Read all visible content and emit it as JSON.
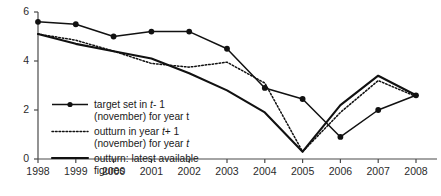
{
  "chart_data": {
    "type": "line",
    "title": "",
    "xlabel": "",
    "ylabel": "",
    "grid": false,
    "legend_position": "inside-lower-left",
    "categories": [
      "1998",
      "1999",
      "2000",
      "2001",
      "2002",
      "2003",
      "2004",
      "2005",
      "2006",
      "2007",
      "2008"
    ],
    "x": [
      1998,
      1999,
      2000,
      2001,
      2002,
      2003,
      2004,
      2005,
      2006,
      2007,
      2008
    ],
    "xlim": [
      1998,
      2008
    ],
    "ylim": [
      0,
      6
    ],
    "yticks": [
      0,
      2,
      4,
      6
    ],
    "ytick_labels": [
      "0",
      "2",
      "4",
      "6"
    ],
    "xtick_labels": [
      "1998",
      "1999",
      "2000",
      "2001",
      "2002",
      "2003",
      "2004",
      "2005",
      "2006",
      "2007",
      "2008"
    ],
    "series": [
      {
        "name": "target set in t-1 (november) for year t",
        "style": "solid-with-markers",
        "marker": "filled-circle",
        "values": [
          5.6,
          5.5,
          5.0,
          5.2,
          5.2,
          4.5,
          2.9,
          2.45,
          0.9,
          2.0,
          2.6
        ]
      },
      {
        "name": "outturn in year t+1 (november) for year t",
        "style": "dotted",
        "marker": "none",
        "values": [
          5.1,
          4.85,
          4.4,
          3.9,
          3.75,
          3.95,
          3.1,
          0.3,
          1.9,
          3.2,
          2.55
        ]
      },
      {
        "name": "outturn: latest available figures",
        "style": "solid-thick",
        "marker": "none",
        "values": [
          5.1,
          4.7,
          4.4,
          4.1,
          3.5,
          2.8,
          1.9,
          0.3,
          2.2,
          3.4,
          2.6
        ]
      }
    ]
  },
  "legend": {
    "items": [
      {
        "key": "target",
        "swatch": "line-with-marker",
        "line1_pre": "target set in ",
        "line1_italic": "t",
        "line1_post": "- 1",
        "line2": "(november) for year t"
      },
      {
        "key": "outturn_t1",
        "swatch": "dotted-line",
        "line1_pre": "outturn in year ",
        "line1_italic": "t",
        "line1_post": "+ 1",
        "line2_pre": "(november) for year ",
        "line2_italic": "t",
        "line2_post": ""
      },
      {
        "key": "latest",
        "swatch": "solid-line",
        "line1": "outturn: latest available",
        "line2": "figures"
      }
    ]
  },
  "colors": {
    "series_line": "#111111",
    "axis": "#4a4a4a",
    "text": "#1a1a1a",
    "background": "#ffffff"
  }
}
